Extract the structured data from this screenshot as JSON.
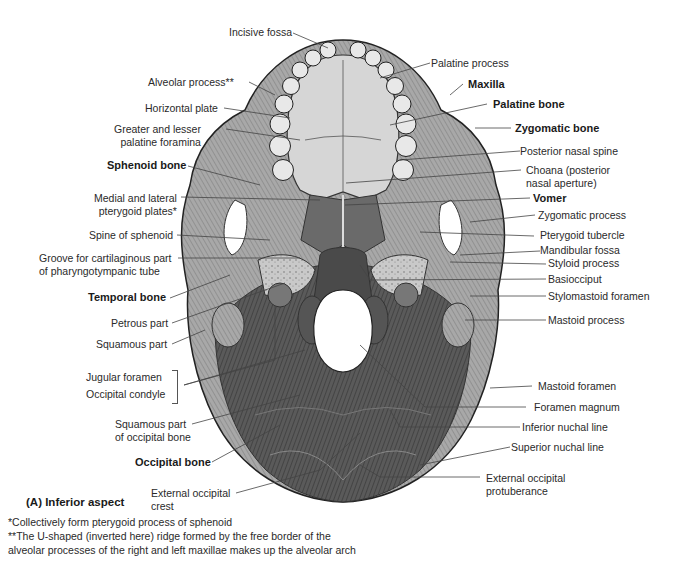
{
  "figure": {
    "caption": "(A) Inferior aspect",
    "view": "Inferior aspect of the skull",
    "labels_left": [
      {
        "id": "alveolar-process",
        "text": "Alveolar process**",
        "bold": false
      },
      {
        "id": "horizontal-plate",
        "text": "Horizontal plate",
        "bold": false
      },
      {
        "id": "greater-lesser-palatine-foramina",
        "text": "Greater and lesser\npalatine foramina",
        "bold": false
      },
      {
        "id": "sphenoid-bone",
        "text": "Sphenoid bone",
        "bold": true
      },
      {
        "id": "medial-lateral-pterygoid-plates",
        "text": "Medial and lateral\npterygoid plates*",
        "bold": false
      },
      {
        "id": "spine-of-sphenoid",
        "text": "Spine of sphenoid",
        "bold": false
      },
      {
        "id": "groove-pharyngotympanic-tube",
        "text": "Groove for cartilaginous part\nof pharyngotympanic tube",
        "bold": false
      },
      {
        "id": "temporal-bone",
        "text": "Temporal bone",
        "bold": true
      },
      {
        "id": "petrous-part",
        "text": "Petrous part",
        "bold": false
      },
      {
        "id": "squamous-part",
        "text": "Squamous part",
        "bold": false
      },
      {
        "id": "jugular-foramen",
        "text": "Jugular foramen",
        "bold": false
      },
      {
        "id": "occipital-condyle",
        "text": "Occipital condyle",
        "bold": false
      },
      {
        "id": "squamous-part-occipital",
        "text": "Squamous part\nof occipital bone",
        "bold": false
      },
      {
        "id": "occipital-bone",
        "text": "Occipital bone",
        "bold": true
      },
      {
        "id": "external-occipital-crest",
        "text": "External occipital\ncrest",
        "bold": false
      }
    ],
    "labels_top": [
      {
        "id": "incisive-fossa",
        "text": "Incisive fossa",
        "bold": false
      }
    ],
    "labels_right": [
      {
        "id": "palatine-process",
        "text": "Palatine process",
        "bold": false
      },
      {
        "id": "maxilla",
        "text": "Maxilla",
        "bold": true
      },
      {
        "id": "palatine-bone",
        "text": "Palatine bone",
        "bold": true
      },
      {
        "id": "zygomatic-bone",
        "text": "Zygomatic bone",
        "bold": true
      },
      {
        "id": "posterior-nasal-spine",
        "text": "Posterior nasal spine",
        "bold": false
      },
      {
        "id": "choana",
        "text": "Choana (posterior\nnasal aperture)",
        "bold": false
      },
      {
        "id": "vomer",
        "text": "Vomer",
        "bold": true
      },
      {
        "id": "zygomatic-process",
        "text": "Zygomatic process",
        "bold": false
      },
      {
        "id": "pterygoid-tubercle",
        "text": "Pterygoid tubercle",
        "bold": false
      },
      {
        "id": "mandibular-fossa",
        "text": "Mandibular fossa",
        "bold": false
      },
      {
        "id": "styloid-process",
        "text": "Styloid process",
        "bold": false
      },
      {
        "id": "basiocciput",
        "text": "Basiocciput",
        "bold": false
      },
      {
        "id": "stylomastoid-foramen",
        "text": "Stylomastoid foramen",
        "bold": false
      },
      {
        "id": "mastoid-process",
        "text": "Mastoid process",
        "bold": false
      },
      {
        "id": "mastoid-foramen",
        "text": "Mastoid foramen",
        "bold": false
      },
      {
        "id": "foramen-magnum",
        "text": "Foramen magnum",
        "bold": false
      },
      {
        "id": "inferior-nuchal-line",
        "text": "Inferior nuchal line",
        "bold": false
      },
      {
        "id": "superior-nuchal-line",
        "text": "Superior nuchal line",
        "bold": false
      },
      {
        "id": "external-occipital-protuberance",
        "text": "External occipital\nprotuberance",
        "bold": false
      }
    ],
    "footnotes": [
      "*Collectively form pterygoid process of sphenoid",
      "**The U-shaped (inverted here) ridge formed by the free border of the",
      "alveolar processes of the right and left maxillae makes up the alveolar arch"
    ]
  }
}
